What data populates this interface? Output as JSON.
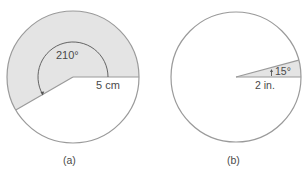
{
  "figures": [
    {
      "id": "a",
      "caption": "(a)",
      "angle_label": "210°",
      "radius_label": "5 cm",
      "angle_deg": 210,
      "shaded_color": "#e4e4e4"
    },
    {
      "id": "b",
      "caption": "(b)",
      "angle_label": "15°",
      "radius_label": "2 in.",
      "angle_deg": 15,
      "shaded_color": "#e4e4e4"
    }
  ],
  "colors": {
    "outline": "#9a9a9a",
    "text": "#4a4a4a",
    "arc": "#555555"
  }
}
